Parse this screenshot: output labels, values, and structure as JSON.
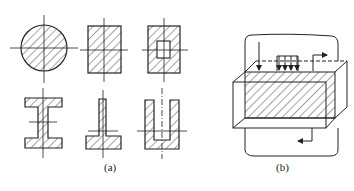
{
  "figure_a": {
    "label": "(a)",
    "shapes": [
      {
        "name": "solid-circle-section"
      },
      {
        "name": "solid-rectangle-section"
      },
      {
        "name": "hollow-rectangle-section"
      },
      {
        "name": "i-beam-section"
      },
      {
        "name": "inverted-t-section"
      },
      {
        "name": "u-channel-section"
      }
    ]
  },
  "figure_b": {
    "label": "(b)"
  },
  "colors": {
    "stroke": "#222222",
    "background": "#ffffff"
  }
}
